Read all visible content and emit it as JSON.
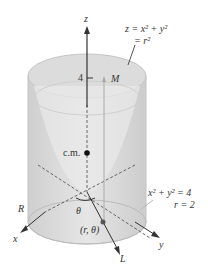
{
  "figure": {
    "axes": {
      "z": "z",
      "x": "x",
      "y": "y",
      "L": "L"
    },
    "surface_label_line1": "z = x² + y²",
    "surface_label_line2": "= r²",
    "cylinder_label_line1": "x² + y² = 4",
    "cylinder_label_line2": "r = 2",
    "tick_label": "4",
    "mass_label": "M",
    "center_of_mass_label": "c.m.",
    "region_label": "R",
    "angle_label": "θ",
    "point_label": "(r, θ)",
    "colors": {
      "solid_fill": "#d9d9d9",
      "edge": "#bdbdbd",
      "axis": "#333333",
      "dashed": "#666666"
    }
  }
}
